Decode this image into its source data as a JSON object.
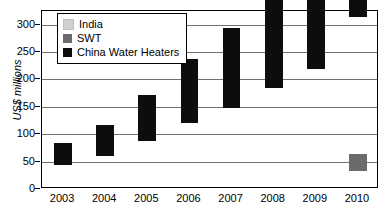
{
  "chart_data": {
    "type": "bar",
    "title": "",
    "subtitle": "",
    "xlabel": "",
    "ylabel": "US$ millions",
    "categories": [
      "2003",
      "2004",
      "2005",
      "2006",
      "2007",
      "2008",
      "2009",
      "2010"
    ],
    "series": [
      {
        "name": "China Water Heaters",
        "color": "#0d0d0d",
        "values": [
          40,
          57,
          84,
          117,
          145,
          181,
          215,
          280
        ]
      },
      {
        "name": "SWT",
        "color": "#6b6b6b",
        "values": [
          0,
          0,
          0,
          0,
          0,
          0,
          0,
          30
        ]
      },
      {
        "name": "India",
        "color": "#cfcfcf",
        "values": [
          0,
          0,
          0,
          0,
          0,
          0,
          0,
          0
        ]
      }
    ],
    "stacked": true,
    "ylim": [
      0,
      325
    ],
    "yticks": [
      0,
      50,
      100,
      150,
      200,
      250,
      300
    ],
    "ytick_labels": [
      "0",
      "50",
      "100",
      "150",
      "200",
      "250",
      "300"
    ],
    "grid": true,
    "legend_position": "top-left"
  },
  "legend": {
    "items": [
      {
        "label": "India",
        "color": "#cfcfcf"
      },
      {
        "label": "SWT",
        "color": "#6b6b6b"
      },
      {
        "label": "China Water Heaters",
        "color": "#0d0d0d"
      }
    ]
  },
  "axes": {
    "y_title": "US$ millions"
  }
}
